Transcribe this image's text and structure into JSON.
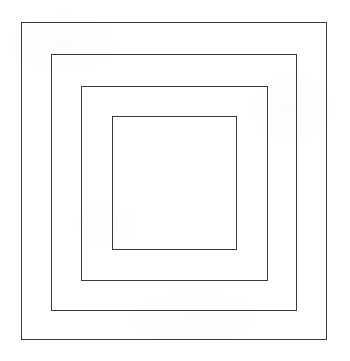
{
  "figure": {
    "canvas": {
      "width": 350,
      "height": 361,
      "background_color": "#ffffff"
    },
    "style": {
      "stroke_color": "#3a3a3a",
      "stroke_width_px": 1.3,
      "fill": "none"
    },
    "shape_count": 4,
    "shapes": [
      {
        "name": "outer-square",
        "order": 1,
        "label": "Square 1 (outermost)",
        "x": 21,
        "y": 22,
        "width": 306,
        "height": 318,
        "right": 327,
        "bottom": 340,
        "stroke_color": "#3a3a3a",
        "stroke_width_px": 1.4,
        "fill": "none"
      },
      {
        "name": "second-square",
        "order": 2,
        "label": "Square 2",
        "x": 51,
        "y": 54,
        "width": 246,
        "height": 257,
        "right": 297,
        "bottom": 311,
        "stroke_color": "#3a3a3a",
        "stroke_width_px": 1.3,
        "fill": "none"
      },
      {
        "name": "third-square",
        "order": 3,
        "label": "Square 3",
        "x": 81,
        "y": 86,
        "width": 187,
        "height": 195,
        "right": 268,
        "bottom": 281,
        "stroke_color": "#3a3a3a",
        "stroke_width_px": 1.3,
        "fill": "none"
      },
      {
        "name": "inner-square",
        "order": 4,
        "label": "Square 4 (innermost)",
        "x": 112,
        "y": 116,
        "width": 125,
        "height": 134,
        "right": 237,
        "bottom": 250,
        "stroke_color": "#3a3a3a",
        "stroke_width_px": 1.3,
        "fill": "none"
      }
    ]
  }
}
